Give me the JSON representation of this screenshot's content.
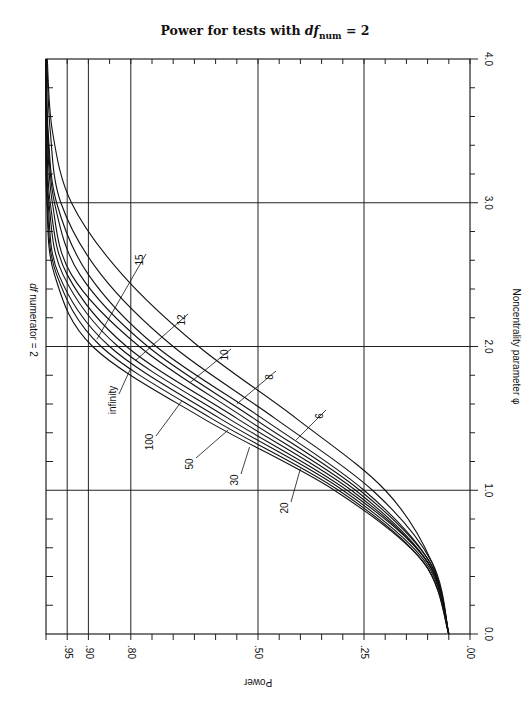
{
  "chart_data": {
    "type": "line",
    "orientation": "rotated-90 (phi on vertical axis increasing upward, power on horizontal axis increasing leftward)",
    "title_prefix": "Power for tests with ",
    "title_var": "df",
    "title_sub": "num",
    "title_suffix": " = 2",
    "inner_label": "df numerator = 2",
    "xlabel": "Noncentrality parameter φ",
    "ylabel": "Power",
    "x_ticks": [
      "0.0",
      "1.0",
      "2.0",
      "3.0",
      "4.0"
    ],
    "x_range": [
      0,
      4
    ],
    "y_tick_labels": [
      ".00",
      ".25",
      ".50",
      ".80",
      ".90",
      ".95"
    ],
    "y_tick_values": [
      0,
      0.25,
      0.5,
      0.8,
      0.9,
      0.95
    ],
    "y_range": [
      0,
      1
    ],
    "grid": true,
    "x": [
      0,
      0.5,
      1.0,
      1.5,
      2.0,
      2.5,
      3.0,
      3.5,
      4.0
    ],
    "series": [
      {
        "name": "infinity",
        "values": [
          0.05,
          0.11,
          0.32,
          0.63,
          0.89,
          0.98,
          0.998,
          1.0,
          1.0
        ]
      },
      {
        "name": "100",
        "values": [
          0.05,
          0.11,
          0.31,
          0.61,
          0.87,
          0.975,
          0.997,
          1.0,
          1.0
        ]
      },
      {
        "name": "50",
        "values": [
          0.05,
          0.105,
          0.3,
          0.59,
          0.85,
          0.97,
          0.995,
          1.0,
          1.0
        ]
      },
      {
        "name": "30",
        "values": [
          0.05,
          0.1,
          0.29,
          0.57,
          0.83,
          0.96,
          0.993,
          0.999,
          1.0
        ]
      },
      {
        "name": "20",
        "values": [
          0.05,
          0.1,
          0.28,
          0.55,
          0.81,
          0.95,
          0.99,
          0.998,
          1.0
        ]
      },
      {
        "name": "15",
        "values": [
          0.05,
          0.1,
          0.27,
          0.53,
          0.78,
          0.94,
          0.985,
          0.997,
          1.0
        ]
      },
      {
        "name": "12",
        "values": [
          0.05,
          0.095,
          0.26,
          0.51,
          0.76,
          0.92,
          0.98,
          0.996,
          1.0
        ]
      },
      {
        "name": "10",
        "values": [
          0.05,
          0.095,
          0.25,
          0.49,
          0.74,
          0.9,
          0.975,
          0.995,
          0.999
        ]
      },
      {
        "name": "8",
        "values": [
          0.05,
          0.09,
          0.23,
          0.46,
          0.7,
          0.87,
          0.965,
          0.99,
          0.998
        ]
      },
      {
        "name": "6",
        "values": [
          0.05,
          0.09,
          0.2,
          0.41,
          0.64,
          0.82,
          0.94,
          0.985,
          0.997
        ]
      }
    ],
    "curve_labels": [
      {
        "text": "infinity",
        "phi": 1.85,
        "power": 0.8,
        "lx": 113,
        "ly": 400
      },
      {
        "text": "100",
        "phi": 1.62,
        "power": 0.68,
        "lx": 150,
        "ly": 442
      },
      {
        "text": "50",
        "phi": 1.42,
        "power": 0.57,
        "lx": 190,
        "ly": 464
      },
      {
        "text": "30",
        "phi": 1.3,
        "power": 0.52,
        "lx": 235,
        "ly": 480
      },
      {
        "text": "20",
        "phi": 1.15,
        "power": 0.4,
        "lx": 285,
        "ly": 508
      },
      {
        "text": "15",
        "phi": 2.05,
        "power": 0.88,
        "lx": 140,
        "ly": 260
      },
      {
        "text": "12",
        "phi": 1.9,
        "power": 0.79,
        "lx": 182,
        "ly": 320
      },
      {
        "text": "10",
        "phi": 1.75,
        "power": 0.66,
        "lx": 225,
        "ly": 355
      },
      {
        "text": "8",
        "phi": 1.6,
        "power": 0.55,
        "lx": 270,
        "ly": 377
      },
      {
        "text": "6",
        "phi": 1.35,
        "power": 0.41,
        "lx": 320,
        "ly": 416
      }
    ]
  },
  "title": {
    "prefix": "Power for tests with ",
    "var": "df",
    "sub": "num",
    "suffix": " = 2"
  }
}
